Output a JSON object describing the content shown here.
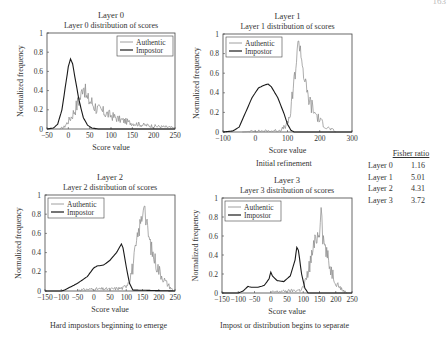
{
  "page_number": "163",
  "fisher_table": {
    "header": "Fisher ratio",
    "rows": [
      {
        "label": "Layer 0",
        "value": "1.16"
      },
      {
        "label": "Layer 1",
        "value": "5.01"
      },
      {
        "label": "Layer 2",
        "value": "4.31"
      },
      {
        "label": "Layer 3",
        "value": "3.72"
      }
    ]
  },
  "captions": {
    "layer1": "Initial refinement",
    "layer2": "Hard impostors beginning to emerge",
    "layer3": "Impost or distribution begins to separate"
  },
  "colors": {
    "authentic": "#888888",
    "impostor": "#1a1a1a",
    "axis": "#444444"
  },
  "chart_data": [
    {
      "type": "line",
      "title": "Layer 0",
      "subtitle": "Layer 0 distribution of scores",
      "xlabel": "Score value",
      "ylabel": "Normalized frequency",
      "xlim": [
        -50,
        250
      ],
      "ylim": [
        0,
        1
      ],
      "xticks": [
        -50,
        0,
        50,
        100,
        150,
        200,
        250
      ],
      "yticks": [
        0,
        0.2,
        0.4,
        0.6,
        0.8,
        1
      ],
      "legend": {
        "position": "upper right",
        "entries": [
          "Authentic",
          "Impostor"
        ]
      },
      "series": [
        {
          "name": "Authentic",
          "x": [
            -20,
            -10,
            0,
            10,
            20,
            30,
            35,
            40,
            45,
            50,
            60,
            70,
            80,
            100,
            120,
            150,
            180,
            200,
            230,
            250
          ],
          "y": [
            0,
            0.02,
            0.08,
            0.15,
            0.25,
            0.35,
            0.48,
            0.38,
            0.3,
            0.3,
            0.25,
            0.2,
            0.18,
            0.14,
            0.1,
            0.06,
            0.04,
            0.03,
            0.02,
            0.01
          ]
        },
        {
          "name": "Impostor",
          "x": [
            -50,
            -35,
            -25,
            -15,
            -5,
            0,
            5,
            10,
            15,
            25,
            35,
            45,
            55,
            70,
            250
          ],
          "y": [
            0,
            0.01,
            0.05,
            0.2,
            0.5,
            0.65,
            0.73,
            0.68,
            0.55,
            0.3,
            0.12,
            0.04,
            0.01,
            0,
            0
          ]
        }
      ]
    },
    {
      "type": "line",
      "title": "Layer 1",
      "subtitle": "Layer 1 distribution of scores",
      "xlabel": "Score value",
      "ylabel": "Normalized frequency",
      "xlim": [
        -100,
        300
      ],
      "ylim": [
        0,
        1
      ],
      "xticks": [
        -100,
        0,
        100,
        200,
        300
      ],
      "yticks": [
        0,
        0.2,
        0.4,
        0.6,
        0.8,
        1
      ],
      "legend": {
        "position": "upper left",
        "entries": [
          "Authentic",
          "Impostor"
        ]
      },
      "series": [
        {
          "name": "Authentic",
          "x": [
            -40,
            0,
            50,
            80,
            100,
            110,
            120,
            130,
            135,
            140,
            150,
            160,
            170,
            180,
            200,
            220,
            240,
            250
          ],
          "y": [
            0,
            0.01,
            0.01,
            0.02,
            0.08,
            0.2,
            0.5,
            0.8,
            0.95,
            0.85,
            0.6,
            0.4,
            0.3,
            0.22,
            0.12,
            0.05,
            0.02,
            0
          ]
        },
        {
          "name": "Impostor",
          "x": [
            -100,
            -70,
            -50,
            -30,
            -10,
            10,
            30,
            40,
            50,
            70,
            90,
            100,
            110,
            120,
            300
          ],
          "y": [
            0,
            0.01,
            0.05,
            0.2,
            0.35,
            0.45,
            0.48,
            0.49,
            0.46,
            0.35,
            0.18,
            0.08,
            0.02,
            0,
            0
          ]
        }
      ]
    },
    {
      "type": "line",
      "title": "Layer 2",
      "subtitle": "Layer 2 distribution of scores",
      "xlabel": "Score value",
      "ylabel": "Normalized frequency",
      "xlim": [
        -150,
        250
      ],
      "ylim": [
        0,
        1
      ],
      "xticks": [
        -150,
        -100,
        -50,
        0,
        50,
        100,
        150,
        200,
        250
      ],
      "yticks": [
        0,
        0.2,
        0.4,
        0.6,
        0.8,
        1
      ],
      "legend": {
        "position": "upper left",
        "entries": [
          "Authentic",
          "Impostor"
        ]
      },
      "series": [
        {
          "name": "Authentic",
          "x": [
            -50,
            0,
            50,
            90,
            100,
            110,
            120,
            130,
            140,
            150,
            155,
            160,
            170,
            180,
            200,
            220,
            240,
            245
          ],
          "y": [
            0.01,
            0.02,
            0.02,
            0.03,
            0.06,
            0.12,
            0.25,
            0.45,
            0.65,
            0.8,
            0.97,
            0.75,
            0.55,
            0.4,
            0.22,
            0.1,
            0.02,
            0
          ]
        },
        {
          "name": "Impostor",
          "x": [
            -150,
            -100,
            -90,
            -50,
            -20,
            0,
            10,
            30,
            50,
            70,
            80,
            85,
            90,
            100,
            110,
            120,
            250
          ],
          "y": [
            0,
            0,
            0.01,
            0.08,
            0.15,
            0.24,
            0.26,
            0.27,
            0.32,
            0.4,
            0.46,
            0.49,
            0.45,
            0.25,
            0.08,
            0.01,
            0
          ]
        }
      ]
    },
    {
      "type": "line",
      "title": "Layer 3",
      "subtitle": "Layer 3 distribution of scores",
      "xlabel": "Score value",
      "ylabel": "Normalized frequency",
      "xlim": [
        -150,
        250
      ],
      "ylim": [
        0,
        1
      ],
      "xticks": [
        -150,
        -100,
        -50,
        0,
        50,
        100,
        150,
        200,
        250
      ],
      "yticks": [
        0,
        0.2,
        0.4,
        0.6,
        0.8,
        1
      ],
      "legend": {
        "position": "upper left",
        "entries": [
          "Authentic",
          "Impostor"
        ]
      },
      "series": [
        {
          "name": "Authentic",
          "x": [
            0,
            50,
            90,
            100,
            110,
            120,
            130,
            140,
            150,
            155,
            160,
            170,
            180,
            200,
            220,
            235
          ],
          "y": [
            0.01,
            0.02,
            0.03,
            0.06,
            0.15,
            0.3,
            0.45,
            0.58,
            0.65,
            0.98,
            0.6,
            0.45,
            0.3,
            0.12,
            0.03,
            0
          ]
        },
        {
          "name": "Impostor",
          "x": [
            -150,
            -100,
            -85,
            -70,
            -60,
            -40,
            -20,
            -5,
            0,
            5,
            20,
            40,
            60,
            75,
            80,
            85,
            95,
            105,
            115,
            250
          ],
          "y": [
            0,
            0,
            0.02,
            0.07,
            0.06,
            0.06,
            0.08,
            0.15,
            0.22,
            0.18,
            0.13,
            0.12,
            0.18,
            0.35,
            0.48,
            0.45,
            0.2,
            0.05,
            0,
            0
          ]
        }
      ]
    }
  ]
}
